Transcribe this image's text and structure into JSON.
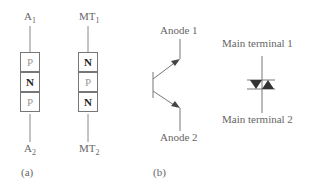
{
  "figure": {
    "panel_a": {
      "caption": "(a)",
      "diac_structure": {
        "top_terminal": {
          "base": "A",
          "sub": "1"
        },
        "bottom_terminal": {
          "base": "A",
          "sub": "2"
        },
        "layers": [
          "P",
          "N",
          "P"
        ]
      },
      "triac_structure": {
        "top_terminal": {
          "base": "MT",
          "sub": "1"
        },
        "bottom_terminal": {
          "base": "MT",
          "sub": "2"
        },
        "layers": [
          "N",
          "P",
          "N"
        ]
      }
    },
    "panel_b": {
      "caption": "(b)",
      "transistor_symbol": {
        "top_label": "Anode 1",
        "bottom_label": "Anode 2"
      },
      "diac_symbol": {
        "top_label": "Main terminal 1",
        "bottom_label": "Main terminal 2"
      }
    }
  },
  "colors": {
    "line": "#777777",
    "fill": "#333333"
  }
}
